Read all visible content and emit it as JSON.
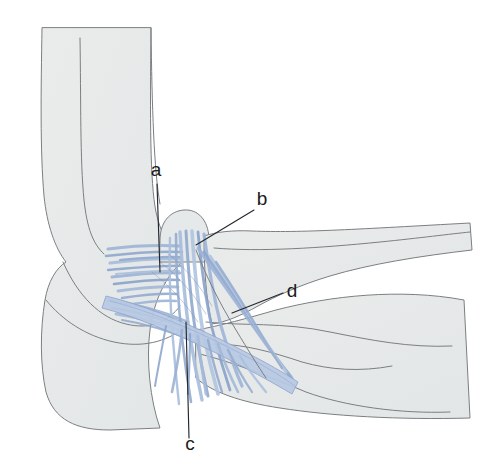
{
  "figure": {
    "background_color": "#ffffff",
    "width": 492,
    "height": 465
  },
  "palette": {
    "bone_fill": "#e6e9e9",
    "bone_fill_light": "#eef0f0",
    "bone_outline": "#7b7f82",
    "ligament_blue": "#8fa8ce",
    "ligament_blue_light": "#b9c9e2",
    "ligament_blue_dark": "#7a93bd",
    "leader_line": "#23282e",
    "label_text": "#1a1a1a"
  },
  "labels": [
    {
      "id": "a",
      "text": "a",
      "text_x": 156,
      "text_y": 176,
      "leader": {
        "x1": 157,
        "y1": 184,
        "x2": 160,
        "y2": 272
      }
    },
    {
      "id": "b",
      "text": "b",
      "text_x": 262,
      "text_y": 205,
      "leader": {
        "x1": 254,
        "y1": 210,
        "x2": 196,
        "y2": 245
      }
    },
    {
      "id": "c",
      "text": "c",
      "text_x": 190,
      "text_y": 450,
      "leader": {
        "x1": 189,
        "y1": 438,
        "x2": 186,
        "y2": 322
      }
    },
    {
      "id": "d",
      "text": "d",
      "text_x": 292,
      "text_y": 297,
      "leader": {
        "x1": 283,
        "y1": 293,
        "x2": 232,
        "y2": 313
      }
    }
  ],
  "structures": [
    {
      "name": "humerus-shaft",
      "kind": "bone"
    },
    {
      "name": "olecranon-ulna",
      "kind": "bone"
    },
    {
      "name": "radius-shaft",
      "kind": "bone"
    },
    {
      "name": "ulna-shaft",
      "kind": "bone"
    },
    {
      "name": "capitellum-prominence",
      "kind": "bone"
    },
    {
      "name": "radial-collateral-ligament",
      "kind": "ligament"
    },
    {
      "name": "annular-ligament",
      "kind": "ligament"
    },
    {
      "name": "ligament-fan-fibers",
      "kind": "ligament"
    }
  ]
}
